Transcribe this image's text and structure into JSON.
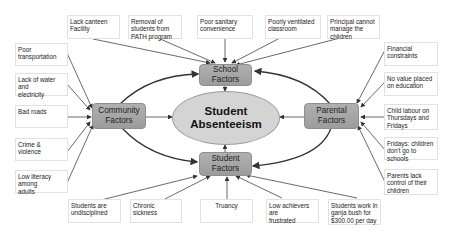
{
  "center": {
    "line1": "Student",
    "line2": "Absenteeism"
  },
  "factors": {
    "school": {
      "line1": "School",
      "line2": "Factors"
    },
    "community": {
      "line1": "Community",
      "line2": "Factors"
    },
    "parental": {
      "line1": "Parental",
      "line2": "Factors"
    },
    "student": {
      "line1": "Student",
      "line2": "Factors"
    }
  },
  "school_causes": [
    {
      "lines": [
        "Lack canteen",
        "Facility"
      ]
    },
    {
      "lines": [
        "Removal of",
        "students from",
        "PATH program"
      ]
    },
    {
      "lines": [
        "Poor sanitary",
        "convenience"
      ]
    },
    {
      "lines": [
        "Poorly ventilated",
        "classroom"
      ]
    },
    {
      "lines": [
        "Principal cannot",
        "manage the",
        "children"
      ]
    }
  ],
  "community_causes": [
    {
      "lines": [
        "Poor transportation"
      ]
    },
    {
      "lines": [
        "Lack of water and",
        "electricity"
      ]
    },
    {
      "lines": [
        "Bad roads"
      ]
    },
    {
      "lines": [
        "Crime & violence"
      ]
    },
    {
      "lines": [
        "Low literacy among",
        " adults"
      ]
    }
  ],
  "parental_causes": [
    {
      "lines": [
        "Financial",
        "constraints"
      ]
    },
    {
      "lines": [
        "No value placed",
        "on education"
      ]
    },
    {
      "lines": [
        "Child labour on",
        "Thursdays and",
        "Fridays"
      ]
    },
    {
      "lines": [
        "Fridays: children",
        "don't go to schools"
      ]
    },
    {
      "lines": [
        "Parents lack",
        "control of their",
        "children"
      ]
    }
  ],
  "student_causes": [
    {
      "lines": [
        "Students are",
        "undisciplined"
      ]
    },
    {
      "lines": [
        "Chronic sickness"
      ]
    },
    {
      "lines": [
        "Truancy"
      ]
    },
    {
      "lines": [
        "Low achievers are",
        "frustrated"
      ]
    },
    {
      "lines": [
        "Students work in",
        "ganja bush for",
        "$300.00 per day"
      ]
    }
  ],
  "colors": {
    "factor_fill": "#a6a6a6",
    "center_fill": "#d4d4d4",
    "arrow": "#333333",
    "box_border": "#e2e2e2"
  }
}
